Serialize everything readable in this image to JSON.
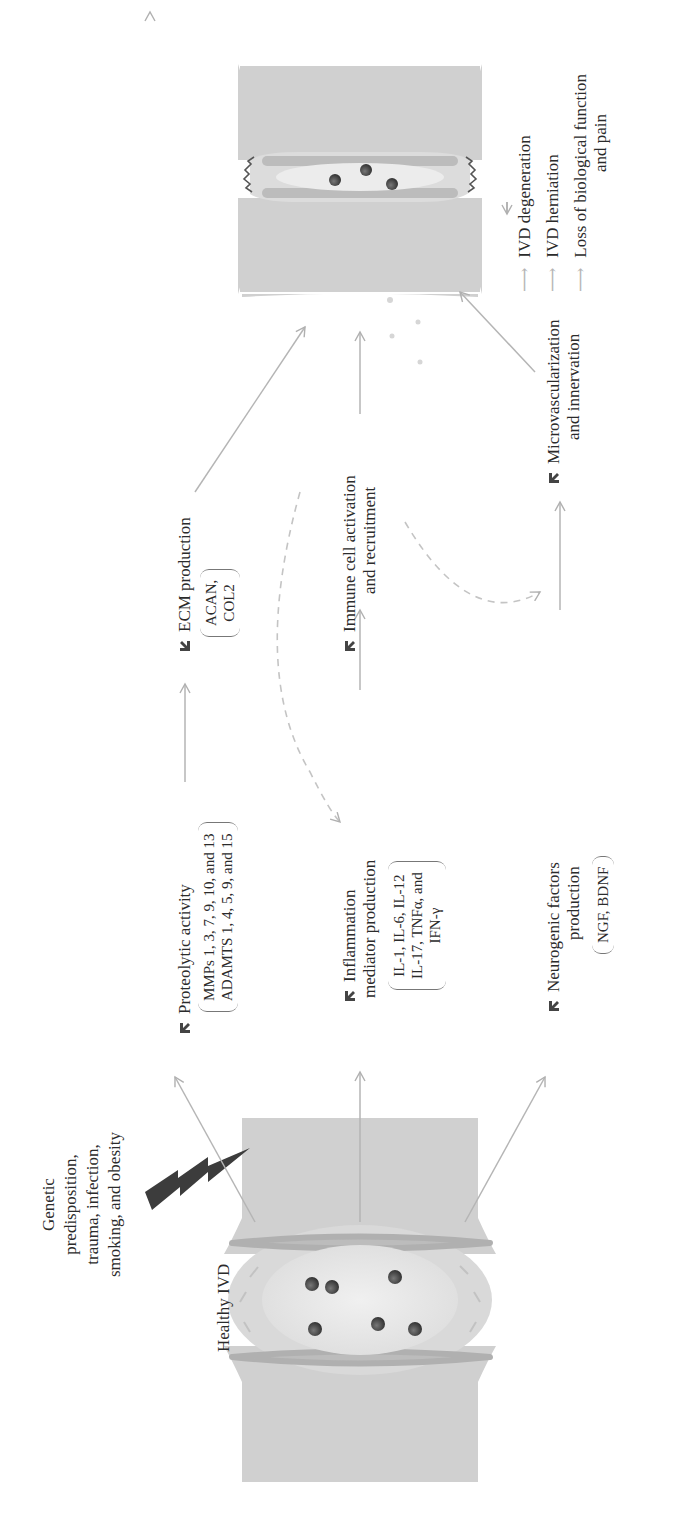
{
  "figure": {
    "orientation": "rotated 90 degrees counter-clockwise",
    "start": {
      "label": "Healthy IVD",
      "risk_factors": [
        "Genetic",
        "predisposition,",
        "trauma, infection,",
        "smoking, and obesity"
      ],
      "icon": "lightning-bolt-icon"
    },
    "pathways": [
      {
        "id": "proteolytic",
        "direction": "up",
        "label_lines": [
          "Proteolytic activity"
        ],
        "details": [
          "MMPs 1, 3, 7, 9, 10, and 13",
          "ADAMTS 1, 4, 5, 9, and 15"
        ],
        "next": {
          "direction": "down",
          "label_lines": [
            "ECM production"
          ],
          "details": [
            "ACAN,",
            "COL2"
          ]
        }
      },
      {
        "id": "inflammation",
        "direction": "up",
        "label_lines": [
          "Inflammation",
          "mediator production"
        ],
        "details": [
          "IL-1, IL-6, IL-12",
          "IL-17, TNFα, and",
          "IFN-γ"
        ],
        "next": {
          "direction": "up",
          "label_lines": [
            "Immune cell activation",
            "and recruitment"
          ]
        }
      },
      {
        "id": "neurogenic",
        "direction": "up",
        "label_lines": [
          "Neurogenic factors",
          "production"
        ],
        "details": [
          "NGF, BDNF"
        ],
        "next": {
          "direction": "up",
          "label_lines": [
            "Microvascularization",
            "and innervation"
          ]
        }
      }
    ],
    "feedback_links": [
      {
        "from": "Immune cell activation and recruitment",
        "to": "Inflammation mediator production",
        "style": "dashed"
      },
      {
        "from": "Immune cell activation and recruitment",
        "to": "Neurogenic factors production",
        "style": "dashed"
      }
    ],
    "outcomes": [
      "IVD degeneration",
      "IVD herniation",
      "Loss of biological function",
      "and pain"
    ],
    "colors": {
      "arrow": "#b5b5b5",
      "dashed": "#c4c4c4",
      "vertebra": "#cfcfcf",
      "annulus": "#bdbdbd",
      "nucleus": "#e6e6e6",
      "cell": "#4a4a4a",
      "bolt": "#3c3c3c",
      "text": "#2b2b2b"
    }
  }
}
